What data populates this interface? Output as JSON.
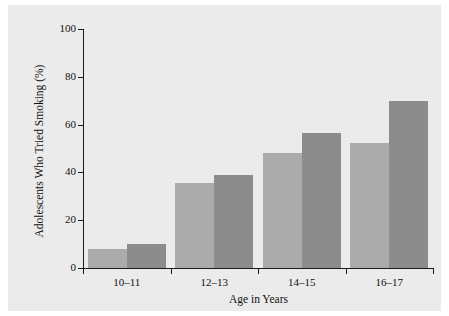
{
  "chart_data": {
    "type": "bar",
    "title": "",
    "xlabel": "Age in Years",
    "ylabel": "Adolescents Who Tried Smoking (%)",
    "categories": [
      "10–11",
      "12–13",
      "14–15",
      "16–17"
    ],
    "series": [
      {
        "name": "light-gray-series",
        "color": "#ababab",
        "values": [
          8,
          35.5,
          48,
          52.5
        ]
      },
      {
        "name": "dark-gray-series",
        "color": "#8c8c8c",
        "values": [
          10,
          39,
          56.5,
          70
        ]
      }
    ],
    "ylim": [
      0,
      100
    ],
    "yticks": [
      0,
      20,
      40,
      60,
      80,
      100
    ],
    "ytick_labels": [
      "0",
      "20",
      "40",
      "60",
      "80",
      "100"
    ],
    "grid": false,
    "legend": "none",
    "background_color": "#ebebeb",
    "axis_color": "#1a1a1a"
  }
}
